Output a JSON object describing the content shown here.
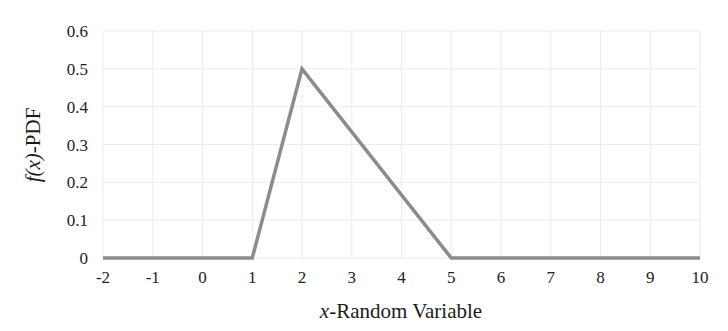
{
  "chart_data": {
    "type": "line",
    "title": "",
    "xlabel_var": "x",
    "xlabel_rest": "-Random Variable",
    "ylabel_var": "f(x)",
    "ylabel_rest": "-PDF",
    "xlim": [
      -2,
      10
    ],
    "ylim": [
      0,
      0.6
    ],
    "xticks": [
      -2,
      -1,
      0,
      1,
      2,
      3,
      4,
      5,
      6,
      7,
      8,
      9,
      10
    ],
    "yticks": [
      0,
      0.1,
      0.2,
      0.3,
      0.4,
      0.5,
      0.6
    ],
    "ytick_labels": [
      "0",
      "0.1",
      "0.2",
      "0.3",
      "0.4",
      "0.5",
      "0.6"
    ],
    "grid": true,
    "legend": null,
    "series": [
      {
        "name": "PDF",
        "color": "#8c8c8c",
        "x": [
          -2,
          1,
          2,
          5,
          10
        ],
        "y": [
          0,
          0,
          0.5,
          0,
          0
        ]
      }
    ]
  },
  "colors": {
    "line": "#8c8c8c",
    "grid": "#ececec",
    "text": "#222222"
  }
}
